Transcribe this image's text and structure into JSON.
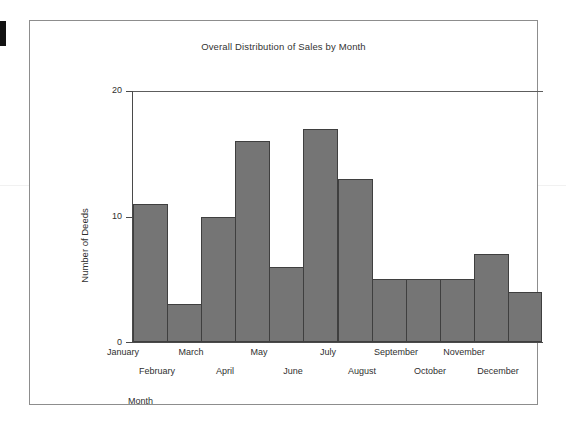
{
  "artifacts": {
    "edge_mark": "",
    "scan_line": ""
  },
  "chart_data": {
    "type": "bar",
    "title": "Overall Distribution of Sales by Month",
    "xlabel": "Month",
    "ylabel": "Number of Deeds",
    "categories": [
      "January",
      "February",
      "March",
      "April",
      "May",
      "June",
      "July",
      "August",
      "September",
      "October",
      "November",
      "December"
    ],
    "values": [
      11,
      3,
      10,
      16,
      6,
      17,
      13,
      5,
      5,
      5,
      7,
      4
    ],
    "ylim": [
      0,
      20
    ],
    "yticks": [
      0,
      10,
      20
    ],
    "ytick_labels": [
      "0",
      "10",
      "20"
    ],
    "grid": false,
    "legend": null,
    "bar_style": "contiguous-histogram",
    "colors": {
      "bar_fill": "#757575",
      "bar_outline": "#3f3f3f",
      "axis": "#4a4a4a",
      "text": "#2f2f2f",
      "frame": "#8d8d8d",
      "background": "#ffffff"
    }
  }
}
